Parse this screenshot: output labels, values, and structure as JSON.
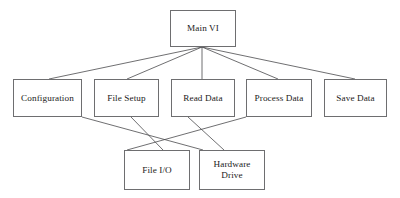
{
  "diagram": {
    "type": "hierarchy-block-diagram",
    "canvas": {
      "width": 400,
      "height": 198
    },
    "colors": {
      "background": "#ffffff",
      "box_border": "#6e6e70",
      "edge_line": "#4a4a4c",
      "text": "#1b1b1b"
    },
    "nodes": [
      {
        "id": "main-vi",
        "label": "Main VI",
        "level": 1,
        "x": 170,
        "y": 10,
        "w": 66,
        "h": 37
      },
      {
        "id": "configuration",
        "label": "Configuration",
        "level": 2,
        "x": 13,
        "y": 79,
        "w": 69,
        "h": 38
      },
      {
        "id": "file-setup",
        "label": "File Setup",
        "level": 2,
        "x": 94,
        "y": 79,
        "w": 65,
        "h": 38
      },
      {
        "id": "read-data",
        "label": "Read Data",
        "level": 2,
        "x": 171,
        "y": 79,
        "w": 64,
        "h": 38
      },
      {
        "id": "process-data",
        "label": "Process Data",
        "level": 2,
        "x": 246,
        "y": 79,
        "w": 66,
        "h": 38
      },
      {
        "id": "save-data",
        "label": "Save Data",
        "level": 2,
        "x": 324,
        "y": 79,
        "w": 63,
        "h": 38
      },
      {
        "id": "file-io",
        "label": "File I/O",
        "level": 3,
        "x": 124,
        "y": 150,
        "w": 66,
        "h": 40
      },
      {
        "id": "hardware-drive",
        "label": "Hardware\nDrive",
        "level": 3,
        "x": 199,
        "y": 150,
        "w": 66,
        "h": 40
      }
    ],
    "edges": [
      {
        "from": "main-vi",
        "to": "configuration",
        "x1": 202,
        "y1": 47,
        "x2": 49,
        "y2": 79
      },
      {
        "from": "main-vi",
        "to": "file-setup",
        "x1": 202,
        "y1": 47,
        "x2": 127,
        "y2": 79
      },
      {
        "from": "main-vi",
        "to": "read-data",
        "x1": 202,
        "y1": 47,
        "x2": 202,
        "y2": 79
      },
      {
        "from": "main-vi",
        "to": "process-data",
        "x1": 202,
        "y1": 47,
        "x2": 278,
        "y2": 79
      },
      {
        "from": "main-vi",
        "to": "save-data",
        "x1": 202,
        "y1": 47,
        "x2": 355,
        "y2": 79
      },
      {
        "from": "configuration",
        "to": "hardware-drive",
        "x1": 82,
        "y1": 117,
        "x2": 203,
        "y2": 150
      },
      {
        "from": "file-setup",
        "to": "file-io",
        "x1": 131,
        "y1": 117,
        "x2": 163,
        "y2": 150
      },
      {
        "from": "read-data",
        "to": "hardware-drive",
        "x1": 188,
        "y1": 117,
        "x2": 224,
        "y2": 150
      },
      {
        "from": "process-data",
        "to": "file-io",
        "x1": 246,
        "y1": 117,
        "x2": 127,
        "y2": 150
      }
    ]
  }
}
